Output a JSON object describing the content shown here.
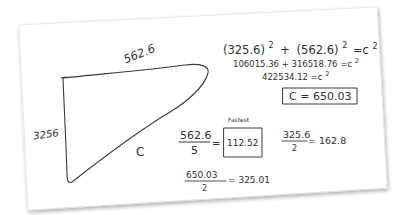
{
  "sheet": {
    "paper_color": "#ffffff",
    "ink_color": "#333333"
  },
  "drawing": {
    "shape": "right-triangle-sketch",
    "side_top_label": "562.6",
    "side_left_label": "3256",
    "hypotenuse_label": "C"
  },
  "equations": {
    "line1": {
      "a": "(325.6)",
      "a_exp": "2",
      "plus": "+",
      "b": "(562.6)",
      "b_exp": "2",
      "rhs": "=c",
      "rhs_exp": "2"
    },
    "line2": {
      "text": "106015.36 + 316518.76 =c",
      "exp": "2"
    },
    "line3": {
      "text": "422534.12 =c",
      "exp": "2"
    },
    "result_boxed": "C = 650.03"
  },
  "calculations": {
    "fastest": {
      "annotation": "Fastest",
      "numerator": "562.6",
      "denominator": "5",
      "equals": "=",
      "result": "112.52"
    },
    "half_side": {
      "numerator": "325.6",
      "denominator": "2",
      "result": "= 162.8"
    },
    "half_hypotenuse": {
      "numerator": "650.03",
      "denominator": "2",
      "result": "= 325.01"
    }
  }
}
